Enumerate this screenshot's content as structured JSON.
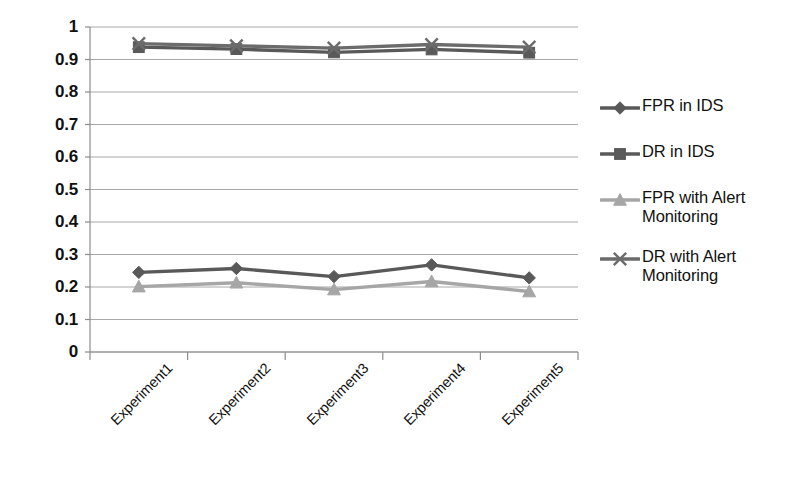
{
  "chart_data": {
    "type": "line",
    "title": "",
    "subtitle": "",
    "xlabel": "",
    "ylabel": "",
    "categories": [
      "Experiment1",
      "Experiment2",
      "Experiment3",
      "Experiment4",
      "Experiment5"
    ],
    "ylim": [
      0,
      1
    ],
    "yticks": [
      "1",
      "0.9",
      "0.8",
      "0.7",
      "0.6",
      "0.5",
      "0.4",
      "0.3",
      "0.2",
      "0.1",
      "0"
    ],
    "ytick_values": [
      1,
      0.9,
      0.8,
      0.7,
      0.6,
      0.5,
      0.4,
      0.3,
      0.2,
      0.1,
      0
    ],
    "grid": true,
    "grid_axis": "y",
    "legend_position": "right",
    "series": [
      {
        "name": "FPR in IDS",
        "marker": "diamond",
        "color": "#595959",
        "values": [
          0.245,
          0.257,
          0.232,
          0.268,
          0.228
        ]
      },
      {
        "name": "DR in IDS",
        "marker": "square",
        "color": "#595959",
        "values": [
          0.938,
          0.932,
          0.922,
          0.931,
          0.921
        ]
      },
      {
        "name": "FPR with Alert Monitoring",
        "marker": "triangle",
        "color": "#a6a6a6",
        "values": [
          0.201,
          0.213,
          0.192,
          0.217,
          0.186
        ]
      },
      {
        "name": "DR with Alert Monitoring",
        "marker": "x",
        "color": "#6b6b6b",
        "values": [
          0.949,
          0.942,
          0.935,
          0.946,
          0.938
        ]
      }
    ]
  },
  "axis": {
    "axis_line_color": "#8c8c8c",
    "grid_color": "#a8a8a8"
  },
  "legend": {
    "items": [
      {
        "label": "FPR in IDS"
      },
      {
        "label": "DR in IDS"
      },
      {
        "label": "FPR with Alert Monitoring"
      },
      {
        "label": "DR with Alert Monitoring"
      }
    ]
  }
}
